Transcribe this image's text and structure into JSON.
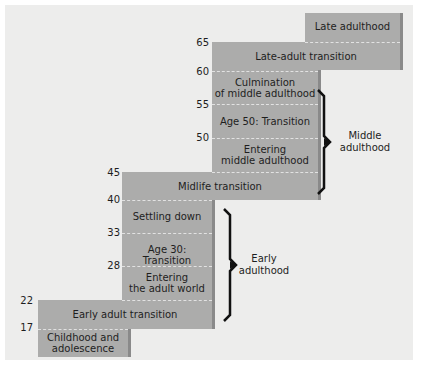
{
  "diagram": {
    "stages": [
      {
        "label": "Late adulthood"
      },
      {
        "label": "Late-adult transition"
      },
      {
        "label": "Culmination\nof middle adulthood"
      },
      {
        "label": "Age 50: Transition"
      },
      {
        "label": "Entering\nmiddle adulthood"
      },
      {
        "label": "Midlife transition"
      },
      {
        "label": "Settling down"
      },
      {
        "label": "Age 30: Transition"
      },
      {
        "label": "Entering\nthe adult world"
      },
      {
        "label": "Early adult transition"
      },
      {
        "label": "Childhood and\nadolescence"
      }
    ],
    "ages": [
      "65",
      "60",
      "55",
      "50",
      "45",
      "40",
      "33",
      "28",
      "22",
      "17"
    ],
    "eras": [
      {
        "label": "Middle\nadulthood"
      },
      {
        "label": "Early\nadulthood"
      }
    ],
    "colors": {
      "block": "#acacab",
      "background": "#ededec",
      "brace": "#111111"
    }
  }
}
